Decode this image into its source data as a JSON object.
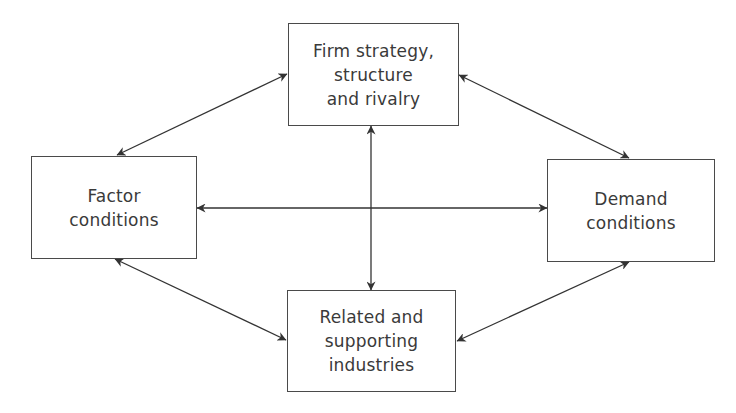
{
  "diagram": {
    "nodes": [
      {
        "id": "firm-strategy",
        "label": "Firm strategy,\nstructure\nand rivalry",
        "x": 288,
        "y": 23,
        "w": 171,
        "h": 103
      },
      {
        "id": "factor-conditions",
        "label": "Factor\nconditions",
        "x": 31,
        "y": 156,
        "w": 166,
        "h": 103
      },
      {
        "id": "demand-conditions",
        "label": "Demand\nconditions",
        "x": 547,
        "y": 159,
        "w": 168,
        "h": 103
      },
      {
        "id": "related-industries",
        "label": "Related and\nsupporting\nindustries",
        "x": 287,
        "y": 290,
        "w": 169,
        "h": 102
      }
    ],
    "edges": [
      {
        "from": "firm-strategy",
        "to": "factor-conditions",
        "x1": 287,
        "y1": 74,
        "x2": 117,
        "y2": 155,
        "bidirectional": true
      },
      {
        "from": "firm-strategy",
        "to": "demand-conditions",
        "x1": 459,
        "y1": 75,
        "x2": 629,
        "y2": 158,
        "bidirectional": true
      },
      {
        "from": "factor-conditions",
        "to": "related-industries",
        "x1": 115,
        "y1": 259,
        "x2": 286,
        "y2": 340,
        "bidirectional": true
      },
      {
        "from": "demand-conditions",
        "to": "related-industries",
        "x1": 629,
        "y1": 262,
        "x2": 457,
        "y2": 341,
        "bidirectional": true
      },
      {
        "from": "factor-conditions",
        "to": "demand-conditions",
        "x1": 197,
        "y1": 208,
        "x2": 547,
        "y2": 208,
        "bidirectional": true
      },
      {
        "from": "firm-strategy",
        "to": "related-industries",
        "x1": 371,
        "y1": 126,
        "x2": 371,
        "y2": 290,
        "bidirectional": true
      }
    ],
    "colors": {
      "stroke": "#4a4a4a",
      "arrow": "#333333",
      "text": "#3a3a3a",
      "background": "#ffffff"
    }
  }
}
